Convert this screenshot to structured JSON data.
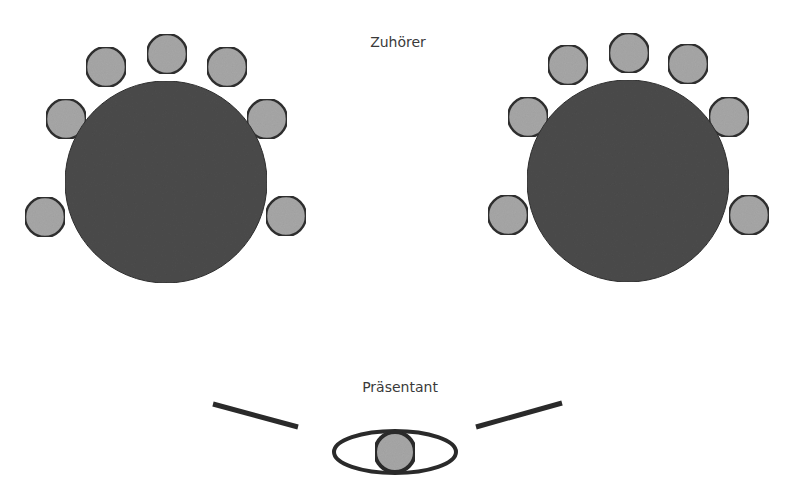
{
  "labels": {
    "audience": "Zuhörer",
    "presenter": "Präsentant"
  },
  "colors": {
    "background": "#ffffff",
    "table_fill": "#4b4b4b",
    "table_stroke": "#2e2e2e",
    "chair_fill": "#a7a7a7",
    "chair_stroke": "#303030",
    "line": "#2a2a2a",
    "text": "#3a3a3a"
  },
  "tables": [
    {
      "name": "left-table",
      "cx": 166,
      "cy": 182,
      "r": 101,
      "chairs": [
        {
          "cx": 45,
          "cy": 217
        },
        {
          "cx": 66,
          "cy": 119
        },
        {
          "cx": 106,
          "cy": 67
        },
        {
          "cx": 167,
          "cy": 54
        },
        {
          "cx": 227,
          "cy": 67
        },
        {
          "cx": 267,
          "cy": 119
        },
        {
          "cx": 286,
          "cy": 216
        }
      ]
    },
    {
      "name": "right-table",
      "cx": 628,
      "cy": 181,
      "r": 101,
      "chairs": [
        {
          "cx": 508,
          "cy": 215
        },
        {
          "cx": 528,
          "cy": 117
        },
        {
          "cx": 568,
          "cy": 65
        },
        {
          "cx": 629,
          "cy": 53
        },
        {
          "cx": 688,
          "cy": 64
        },
        {
          "cx": 729,
          "cy": 117
        },
        {
          "cx": 749,
          "cy": 215
        }
      ]
    }
  ],
  "chair_radius": 20,
  "presenter": {
    "eye": {
      "cx": 395,
      "cy": 452,
      "rx": 61,
      "ry": 21
    },
    "pupil": {
      "cx": 395,
      "cy": 452,
      "r": 20
    },
    "sight_lines": [
      {
        "x1": 213,
        "y1": 404,
        "x2": 298,
        "y2": 427
      },
      {
        "x1": 476,
        "y1": 427,
        "x2": 562,
        "y2": 403
      }
    ]
  }
}
